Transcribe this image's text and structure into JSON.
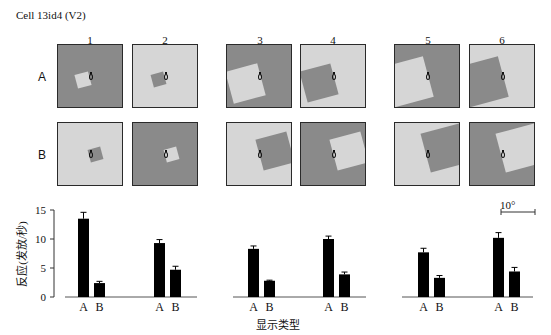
{
  "figure": {
    "title": "Cell 13id4 (V2)",
    "columns": [
      "1",
      "2",
      "3",
      "4",
      "5",
      "6"
    ],
    "rows": [
      "A",
      "B"
    ],
    "colors": {
      "dark_gray": "#8a8a8a",
      "light_gray": "#d6d6d6",
      "frame": "#2a2a2a",
      "bar": "#000000"
    },
    "stimuli": [
      {
        "col": "1",
        "row": "A",
        "background": "dark",
        "square": "light",
        "square_size": "small"
      },
      {
        "col": "2",
        "row": "A",
        "background": "light",
        "square": "dark",
        "square_size": "small"
      },
      {
        "col": "3",
        "row": "A",
        "background": "dark",
        "square": "light",
        "square_size": "large",
        "square_side": "left"
      },
      {
        "col": "4",
        "row": "A",
        "background": "light",
        "square": "dark",
        "square_size": "large",
        "square_side": "left"
      },
      {
        "col": "5",
        "row": "A",
        "background": "dark",
        "square": "light",
        "square_size": "large",
        "square_side": "left"
      },
      {
        "col": "6",
        "row": "A",
        "background": "light",
        "square": "dark",
        "square_size": "large",
        "square_side": "left"
      },
      {
        "col": "1",
        "row": "B",
        "background": "light",
        "square": "dark",
        "square_size": "small"
      },
      {
        "col": "2",
        "row": "B",
        "background": "dark",
        "square": "light",
        "square_size": "small"
      },
      {
        "col": "3",
        "row": "B",
        "background": "light",
        "square": "dark",
        "square_size": "large",
        "square_side": "right"
      },
      {
        "col": "4",
        "row": "B",
        "background": "dark",
        "square": "light",
        "square_size": "large",
        "square_side": "right"
      },
      {
        "col": "5",
        "row": "B",
        "background": "light",
        "square": "dark",
        "square_size": "large",
        "square_side": "right"
      },
      {
        "col": "6",
        "row": "B",
        "background": "dark",
        "square": "light",
        "square_size": "large",
        "square_side": "right"
      }
    ],
    "scale_bar_label": "10°"
  },
  "chart_data": {
    "type": "bar",
    "title": "",
    "xlabel": "显示类型",
    "ylabel": "反应(发放/秒)",
    "ylim": [
      0,
      15
    ],
    "yticks": [
      0,
      5,
      10,
      15
    ],
    "grid": false,
    "legend": null,
    "categories": [
      "1",
      "2",
      "3",
      "4",
      "5",
      "6"
    ],
    "bar_labels": [
      "A",
      "B"
    ],
    "series": [
      {
        "name": "A",
        "values": [
          13.5,
          9.3,
          8.3,
          10.0,
          7.7,
          10.2
        ],
        "errors": [
          1.1,
          0.6,
          0.5,
          0.5,
          0.7,
          0.9
        ]
      },
      {
        "name": "B",
        "values": [
          2.4,
          4.7,
          2.8,
          3.9,
          3.3,
          4.4
        ],
        "errors": [
          0.3,
          0.6,
          0.1,
          0.4,
          0.4,
          0.7
        ]
      }
    ],
    "annotations": [
      "10°"
    ]
  }
}
